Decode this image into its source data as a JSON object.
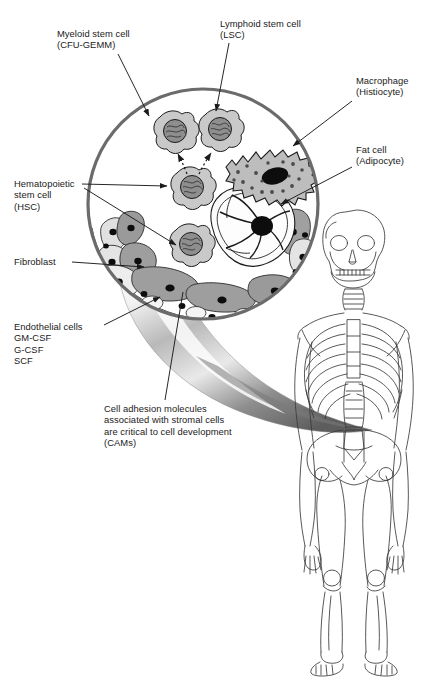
{
  "figure": {
    "background": "#ffffff",
    "width": 431,
    "height": 679
  },
  "colors": {
    "outline": "#1a1a1a",
    "circle_border": "#6b6b6b",
    "stem_cell_body": "#c9c9c9",
    "stem_cell_nucleus": "#8e8e8e",
    "macrophage_body": "#bdbdbd",
    "macrophage_nucleus": "#0d0d0d",
    "fat_cell_body": "#fafafa",
    "fat_cell_nucleus": "#0d0d0d",
    "fibroblast_light": "#e3e3e3",
    "fibroblast_dark": "#9e9e9e",
    "endothelial_fill": "#efefef",
    "cone_highlight": "#fdfdfd",
    "cone_shadow": "#6e6e6e",
    "skeleton_line": "#3a3a3a",
    "text": "#1a1a1a"
  },
  "labels": [
    {
      "id": "myeloid-stem-cell",
      "name": "label-myeloid-stem-cell",
      "lines": [
        "Myeloid stem cell",
        "(CFU-GEMM)"
      ],
      "text": "Myeloid stem cell\n(CFU-GEMM)",
      "x": 57,
      "y": 28,
      "align": "left",
      "leader": {
        "from": [
          125,
          55
        ],
        "to": [
          148,
          115
        ],
        "arrow": true
      }
    },
    {
      "id": "lymphoid-stem-cell",
      "name": "label-lymphoid-stem-cell",
      "lines": [
        "Lymphoid stem cell",
        "(LSC)"
      ],
      "text": "Lymphoid stem cell\n(LSC)",
      "x": 220,
      "y": 18,
      "align": "left",
      "leader": {
        "from": [
          228,
          45
        ],
        "to": [
          216,
          112
        ],
        "arrow": true
      }
    },
    {
      "id": "macrophage",
      "name": "label-macrophage",
      "lines": [
        "Macrophage",
        "(Histiocyte)"
      ],
      "text": "Macrophage\n(Histiocyte)",
      "x": 356,
      "y": 75,
      "align": "left",
      "leader": {
        "from": [
          352,
          100
        ],
        "to": [
          294,
          145
        ],
        "arrow": true
      }
    },
    {
      "id": "fat-cell",
      "name": "label-fat-cell",
      "lines": [
        "Fat cell",
        "(Adipocyte)"
      ],
      "text": "Fat cell\n(Adipocyte)",
      "x": 356,
      "y": 144,
      "align": "left",
      "leader": {
        "from": [
          352,
          166
        ],
        "to": [
          281,
          202
        ],
        "arrow": true
      }
    },
    {
      "id": "hematopoietic-stem-cell",
      "name": "label-hematopoietic-stem-cell",
      "lines": [
        "Hematopoietic",
        "stem cell",
        "(HSC)"
      ],
      "text": "Hematopoietic\nstem cell\n(HSC)",
      "x": 14,
      "y": 178,
      "align": "left",
      "leaders": [
        {
          "from": [
            82,
            183
          ],
          "to": [
            165,
            186
          ],
          "arrow": true
        },
        {
          "from": [
            82,
            186
          ],
          "to": [
            175,
            245
          ],
          "arrow": true
        }
      ]
    },
    {
      "id": "fibroblast",
      "name": "label-fibroblast",
      "lines": [
        "Fibroblast"
      ],
      "text": "Fibroblast",
      "x": 14,
      "y": 258,
      "align": "left",
      "leader": {
        "from": [
          72,
          262
        ],
        "to": [
          144,
          267
        ],
        "arrow": true
      }
    },
    {
      "id": "endothelial-cells",
      "name": "label-endothelial-cells",
      "lines": [
        "Endothelial cells",
        "GM-CSF",
        "G-CSF",
        "SCF"
      ],
      "text": "Endothelial cells\nGM-CSF\nG-CSF\nSCF",
      "x": 14,
      "y": 321,
      "align": "left",
      "leader": {
        "from": [
          105,
          325
        ],
        "to": [
          158,
          295
        ],
        "arrow": true
      }
    },
    {
      "id": "cams",
      "name": "label-cell-adhesion-molecules",
      "lines": [
        "Cell adhesion molecules",
        "associated with stromal cells",
        "are critical to cell development",
        "(CAMs)"
      ],
      "text": "Cell adhesion molecules\nassociated with stromal cells\nare critical to cell development\n(CAMs)",
      "x": 104,
      "y": 403,
      "align": "left",
      "leader": {
        "from": [
          168,
          398
        ],
        "to": [
          183,
          298
        ],
        "arrow": false
      }
    }
  ],
  "diagram": {
    "circle": {
      "cx": 203,
      "cy": 204,
      "r": 116,
      "stroke": "#6b6b6b",
      "stroke_width": 3.2
    },
    "cells": [
      {
        "name": "myeloid-stem-cell",
        "cx": 172,
        "cy": 130,
        "r": 17,
        "type": "stem"
      },
      {
        "name": "lymphoid-stem-cell",
        "cx": 218,
        "cy": 128,
        "r": 17,
        "type": "stem"
      },
      {
        "name": "hematopoietic-stem-cell-upper",
        "cx": 190,
        "cy": 186,
        "r": 17,
        "type": "stem"
      },
      {
        "name": "hematopoietic-stem-cell-lower",
        "cx": 189,
        "cy": 243,
        "r": 17,
        "type": "stem"
      },
      {
        "name": "macrophage-histiocyte",
        "cx": 268,
        "cy": 168,
        "type": "macrophage"
      },
      {
        "name": "fat-cell-adipocyte",
        "cx": 248,
        "cy": 233,
        "type": "adipocyte"
      }
    ],
    "differentiation_arrows": [
      {
        "from": [
          186,
          178
        ],
        "to": [
          175,
          152
        ],
        "style": "dotted"
      },
      {
        "from": [
          197,
          178
        ],
        "to": [
          211,
          150
        ],
        "style": "dotted"
      }
    ],
    "cone": {
      "description": "curved conical magnifier stem from marrow circle to skeleton",
      "gradient_from": "#ffffff",
      "gradient_to": "#5f5f5f"
    },
    "skeleton": {
      "name": "human-skeleton",
      "x": 300,
      "y": 195,
      "width": 128,
      "height": 470,
      "stroke": "#3a3a3a"
    }
  }
}
